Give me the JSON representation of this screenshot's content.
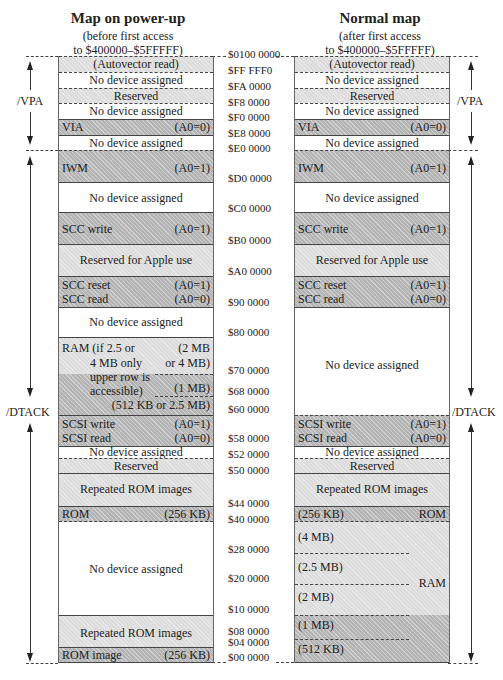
{
  "left_map": {
    "title": "Map on power-up",
    "subtitle_line1": "(before first access",
    "subtitle_line2": "to $400000–$5FFFFF)",
    "blocks": {
      "autovector": "(Autovector read)",
      "nodev1": "No device assigned",
      "reserved1": "Reserved",
      "nodev2": "No device assigned",
      "via": "VIA",
      "via_a0": "(A0=0)",
      "nodev3": "No device assigned",
      "iwm": "IWM",
      "iwm_a0": "(A0=1)",
      "nodev4": "No device assigned",
      "scc_write": "SCC write",
      "scc_write_a0": "(A0=1)",
      "reserved_apple": "Reserved for Apple use",
      "scc_reset": "SCC reset",
      "scc_reset_a0": "(A0=1)",
      "scc_read": "SCC read",
      "scc_read_a0": "(A0=0)",
      "nodev5": "No device assigned",
      "ram_l1": "RAM  (if 2.5 or",
      "ram_l2": "4 MB only",
      "ram_l3": "upper row is",
      "ram_l4": "accessible)",
      "ram_r1": "(2 MB",
      "ram_r2": "or 4 MB)",
      "ram_r3": "(1 MB)",
      "ram_r4": "(512 KB or 2.5 MB)",
      "scsi_write": "SCSI write",
      "scsi_write_a0": "(A0=1)",
      "scsi_read": "SCSI read",
      "scsi_read_a0": "(A0=0)",
      "nodev6": "No device assigned",
      "reserved2": "Reserved",
      "rom_images1": "Repeated ROM images",
      "rom": "ROM",
      "rom_size": "(256 KB)",
      "nodev7": "No device assigned",
      "rom_images2": "Repeated ROM images",
      "rom_image": "ROM image",
      "rom_image_size": "(256 KB)"
    }
  },
  "right_map": {
    "title": "Normal map",
    "subtitle_line1": "(after first access",
    "subtitle_line2": "to $400000–$5FFFFF)",
    "blocks": {
      "autovector": "(Autovector read)",
      "nodev1": "No device assigned",
      "reserved1": "Reserved",
      "nodev2": "No device assigned",
      "via": "VIA",
      "via_a0": "(A0=0)",
      "nodev3": "No device assigned",
      "iwm": "IWM",
      "iwm_a0": "(A0=1)",
      "nodev4": "No device assigned",
      "scc_write": "SCC write",
      "scc_write_a0": "(A0=1)",
      "reserved_apple": "Reserved for Apple use",
      "scc_reset": "SCC reset",
      "scc_reset_a0": "(A0=1)",
      "scc_read": "SCC read",
      "scc_read_a0": "(A0=0)",
      "nodev5": "No device assigned",
      "scsi_write": "SCSI write",
      "scsi_write_a0": "(A0=1)",
      "scsi_read": "SCSI read",
      "scsi_read_a0": "(A0=0)",
      "nodev6": "No device assigned",
      "reserved2": "Reserved",
      "rom_images1": "Repeated ROM images",
      "rom_size": "(256 KB)",
      "rom": "ROM",
      "ram_4mb": "(4 MB)",
      "ram_25mb": "(2.5 MB)",
      "ram_2mb": "(2 MB)",
      "ram_1mb": "(1 MB)",
      "ram_512kb": "(512 KB)",
      "ram": "RAM"
    }
  },
  "addresses": [
    "$0100 0000",
    "$FF FFF0",
    "$FA 0000",
    "$F8 0000",
    "$F0 0000",
    "$E8 0000",
    "$E0 0000",
    "$D0 0000",
    "$C0 0000",
    "$B0 0000",
    "$A0 0000",
    "$90 0000",
    "$80 0000",
    "$70 0000",
    "$68 0000",
    "$60 0000",
    "$58 0000",
    "$52 0000",
    "$50 0000",
    "$44 0000",
    "$40 0000",
    "$28 0000",
    "$20 0000",
    "$10 0000",
    "$08 0000",
    "$04 0000",
    "$00 0000"
  ],
  "signals": {
    "vpa": "/VPA",
    "dtack": "/DTACK"
  }
}
